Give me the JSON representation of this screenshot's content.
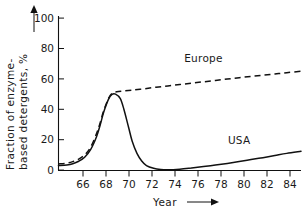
{
  "chart_data": {
    "type": "line",
    "title": "",
    "xlabel": "Year",
    "ylabel": "Fraction of enzyme-based detergents, %",
    "ylabel_line1": "Fraction of enzyme-",
    "ylabel_line2": "based detergents, %",
    "xlim": [
      64.8,
      85.2
    ],
    "ylim": [
      0,
      100
    ],
    "grid": false,
    "legend_position": "inline-annotations",
    "x_ticks": [
      66,
      68,
      70,
      72,
      74,
      76,
      78,
      80,
      82,
      84
    ],
    "x_tick_labels": [
      "66",
      "68",
      "70",
      "72",
      "74",
      "76",
      "78",
      "80",
      "82",
      "84"
    ],
    "y_ticks": [
      0,
      20,
      40,
      60,
      80,
      100
    ],
    "y_tick_labels": [
      "0",
      "20",
      "40",
      "60",
      "80",
      "100"
    ],
    "x_axis_arrow": "⟶",
    "y_axis_arrow": "↑",
    "series": [
      {
        "name": "Europe",
        "style": "dashed",
        "color": "#111111",
        "label_text": "Europe",
        "x": [
          64.8,
          65.5,
          66,
          66.5,
          67,
          67.5,
          68,
          68.3,
          68.6,
          69,
          69.3,
          69.7,
          70.2,
          71,
          72,
          73,
          74,
          75,
          76,
          77,
          78,
          79,
          80,
          81,
          82,
          83,
          84,
          85.2
        ],
        "y": [
          4,
          4.6,
          5.6,
          7.2,
          10,
          15,
          24,
          31,
          39,
          47,
          50.5,
          51.5,
          52,
          52.6,
          53.5,
          54.5,
          55.4,
          56.3,
          57.2,
          58.1,
          59,
          59.9,
          60.8,
          61.6,
          62.4,
          63.2,
          64.1,
          65
        ]
      },
      {
        "name": "USA",
        "style": "solid",
        "color": "#111111",
        "label_text": "USA",
        "x": [
          64.8,
          65.5,
          66,
          66.5,
          67,
          67.5,
          68,
          68.3,
          68.6,
          69,
          69.3,
          69.6,
          70,
          70.3,
          70.7,
          71,
          71.4,
          71.8,
          72.2,
          72.8,
          73.4,
          74,
          75,
          76,
          77,
          78,
          79,
          80,
          81,
          82,
          83,
          84,
          85.2
        ],
        "y": [
          3,
          3.4,
          4.2,
          5.8,
          8.5,
          13.5,
          22,
          29.5,
          38,
          46.5,
          49.8,
          50,
          47,
          40,
          28,
          19,
          11,
          6,
          3,
          1.2,
          0.4,
          0.2,
          0.6,
          1.4,
          2.3,
          3.3,
          4.4,
          5.6,
          6.9,
          8.2,
          9.6,
          11,
          12.4
        ]
      }
    ],
    "annotations": [
      {
        "text": "Europe",
        "x": 77.0,
        "y": 71
      },
      {
        "text": "USA",
        "x": 80.0,
        "y": 17
      }
    ]
  }
}
